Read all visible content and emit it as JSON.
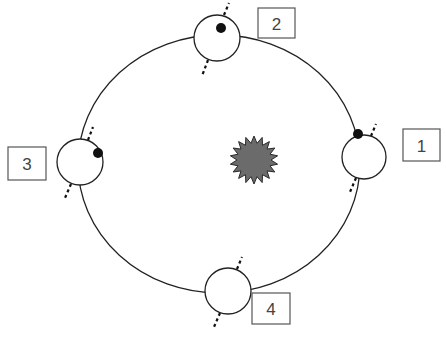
{
  "diagram": {
    "type": "orbit",
    "colors": {
      "line": "#222222",
      "sun_fill": "#6b6b6b",
      "sun_stroke": "#2a2a2a",
      "dot": "#111111",
      "label_box": "#555555",
      "label_text": "#444444"
    },
    "orbit": {
      "cx": 219,
      "cy": 164,
      "rx": 141,
      "ry": 129
    },
    "sun": {
      "cx": 254,
      "cy": 160,
      "r_outer": 24,
      "r_inner": 17,
      "points": 18
    },
    "positions": [
      {
        "id": "1",
        "label": "1",
        "planet": {
          "cx": 364,
          "cy": 157,
          "r": 22
        },
        "dot": {
          "cx": 358,
          "cy": 134,
          "r": 5
        },
        "box": {
          "x": 403,
          "y": 129,
          "w": 37,
          "h": 32
        }
      },
      {
        "id": "2",
        "label": "2",
        "planet": {
          "cx": 217,
          "cy": 38,
          "r": 23
        },
        "dot": {
          "cx": 221,
          "cy": 28,
          "r": 5
        },
        "box": {
          "x": 258,
          "y": 8,
          "w": 37,
          "h": 30
        }
      },
      {
        "id": "3",
        "label": "3",
        "planet": {
          "cx": 80,
          "cy": 162,
          "r": 23
        },
        "dot": {
          "cx": 98,
          "cy": 153,
          "r": 5
        },
        "box": {
          "x": 8,
          "y": 147,
          "w": 38,
          "h": 33
        }
      },
      {
        "id": "4",
        "label": "4",
        "planet": {
          "cx": 228,
          "cy": 291,
          "r": 23
        },
        "dot": null,
        "box": {
          "x": 252,
          "y": 293,
          "w": 38,
          "h": 31
        }
      }
    ]
  }
}
